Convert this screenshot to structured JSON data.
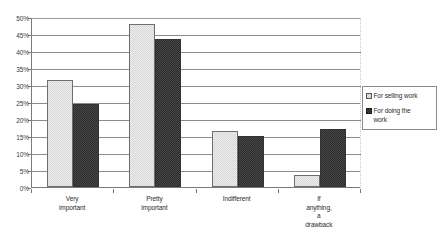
{
  "chart_data": {
    "type": "bar",
    "title": "",
    "subtitle": "",
    "xlabel": "",
    "ylabel": "",
    "categories": [
      "Very important",
      "Pretty important",
      "Indifferent",
      "If anything, a drawback"
    ],
    "category_label_lines": [
      [
        "Very",
        "important"
      ],
      [
        "Pretty",
        "important"
      ],
      [
        "Indifferent"
      ],
      [
        "If",
        "anything,",
        "a",
        "drawback"
      ]
    ],
    "series": [
      {
        "name": "For selling work",
        "values": [
          31.5,
          48,
          16.5,
          3.5
        ],
        "fill": "#ededed",
        "pattern": "light-dither",
        "border": "#6e6e6e"
      },
      {
        "name": "For doing the work",
        "values": [
          24.5,
          43.5,
          15,
          17
        ],
        "fill": "#4a4a4a",
        "pattern": "dark-dither",
        "border": "#333333"
      }
    ],
    "ylim": [
      0,
      50
    ],
    "ytick_step": 5,
    "ytick_labels": [
      "0%",
      "5%",
      "10%",
      "15%",
      "20%",
      "25%",
      "30%",
      "35%",
      "40%",
      "45%",
      "50%"
    ],
    "value_unit": "%",
    "grid": true,
    "grid_axis": "y",
    "legend_position": "right",
    "legend_entries": [
      {
        "label": "For selling work",
        "label_lines": [
          "For selling work"
        ]
      },
      {
        "label": "For doing the work",
        "label_lines": [
          "For doing the",
          "work"
        ]
      }
    ]
  },
  "colors": {
    "background": "#ffffff",
    "gridline": "#8c8c8c",
    "axis": "#7a7a7a",
    "text": "#2b2b2b",
    "series_light": "#ededed",
    "series_dark": "#4a4a4a",
    "legend_border": "#8a8a8a"
  }
}
